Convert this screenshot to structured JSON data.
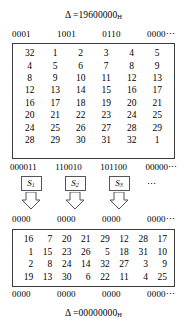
{
  "figure": {
    "delta_top": {
      "symbol": "Δ =",
      "value": "19600000",
      "subscript": "H"
    },
    "delta_bottom": {
      "symbol": "Δ =",
      "value": "00000000",
      "subscript": "H"
    }
  },
  "bits_top": [
    "0001",
    "1001",
    "0110",
    "0000⋯"
  ],
  "bits_sbox_in": [
    "000011",
    "110010",
    "101100",
    "00000⋯"
  ],
  "bits_sbox_out": [
    "0000",
    "0000",
    "0000",
    "0000⋯"
  ],
  "bits_bottom": [
    "0000",
    "0000",
    "0000",
    "0000⋯"
  ],
  "sboxes": [
    {
      "label": "S",
      "subscript": "1"
    },
    {
      "label": "S",
      "subscript": "2"
    },
    {
      "label": "S",
      "subscript": "3"
    }
  ],
  "sbox_ellipsis": "⋯",
  "matrix_top": {
    "rows": [
      [
        "32",
        "1",
        "2",
        "3",
        "4",
        "5"
      ],
      [
        "4",
        "5",
        "6",
        "7",
        "8",
        "9"
      ],
      [
        "8",
        "9",
        "10",
        "11",
        "12",
        "13"
      ],
      [
        "12",
        "13",
        "14",
        "15",
        "16",
        "17"
      ],
      [
        "16",
        "17",
        "18",
        "19",
        "20",
        "21"
      ],
      [
        "20",
        "21",
        "22",
        "23",
        "24",
        "25"
      ],
      [
        "24",
        "25",
        "26",
        "27",
        "28",
        "29"
      ],
      [
        "28",
        "29",
        "30",
        "31",
        "32",
        "1"
      ]
    ]
  },
  "matrix_bottom": {
    "rows": [
      [
        "16",
        "7",
        "20",
        "21",
        "29",
        "12",
        "28",
        "17"
      ],
      [
        "1",
        "15",
        "23",
        "26",
        "5",
        "18",
        "31",
        "10"
      ],
      [
        "2",
        "8",
        "24",
        "14",
        "32",
        "27",
        "3",
        "9"
      ],
      [
        "19",
        "13",
        "30",
        "6",
        "22",
        "11",
        "4",
        "25"
      ]
    ]
  },
  "colors": {
    "ink": "#000000",
    "border": "#3b3b3b",
    "sbox_border": "#555555",
    "background": "#ffffff"
  }
}
